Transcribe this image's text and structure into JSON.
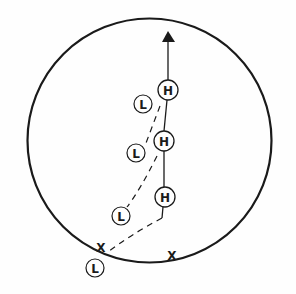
{
  "diagram": {
    "type": "play-diagram",
    "colors": {
      "stroke": "#1a1a1a",
      "background": "#fefefe"
    },
    "field": {
      "shape": "circle",
      "cx": 149.5,
      "cy": 140.5,
      "r": 122
    },
    "arrow": {
      "tip": [
        168,
        31
      ],
      "base_left": [
        162,
        42
      ],
      "base_right": [
        175,
        42
      ]
    },
    "h_markers": [
      {
        "label": "H",
        "cx": 168,
        "cy": 90
      },
      {
        "label": "H",
        "cx": 164,
        "cy": 141
      },
      {
        "label": "H",
        "cx": 165,
        "cy": 197
      }
    ],
    "l_markers": [
      {
        "label": "L",
        "cx": 143,
        "cy": 104
      },
      {
        "label": "L",
        "cx": 136,
        "cy": 153
      },
      {
        "label": "L",
        "cx": 121,
        "cy": 216
      },
      {
        "label": "L",
        "cx": 95,
        "cy": 268
      }
    ],
    "x_markers": [
      {
        "label": "X",
        "x": 101,
        "y": 252
      },
      {
        "label": "X",
        "x": 172,
        "y": 259
      }
    ]
  }
}
